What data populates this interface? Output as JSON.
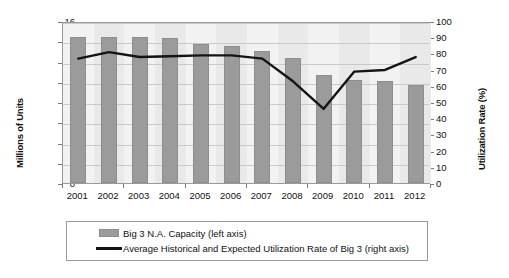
{
  "chart_data": {
    "type": "bar",
    "title": "",
    "subtitle": "",
    "xlabel": "",
    "ylabel": "Millions of Units",
    "y2label": "Utilization Rate (%)",
    "categories": [
      "2001",
      "2002",
      "2003",
      "2004",
      "2005",
      "2006",
      "2007",
      "2008",
      "2009",
      "2010",
      "2011",
      "2012"
    ],
    "ylim": [
      0,
      16
    ],
    "y2lim": [
      0,
      100
    ],
    "yticks": [
      16,
      14,
      12,
      10,
      8,
      6,
      4,
      2,
      0
    ],
    "y2ticks": [
      100,
      90,
      80,
      70,
      60,
      50,
      40,
      30,
      20,
      10,
      0
    ],
    "grid": true,
    "legend_position": "bottom",
    "series": [
      {
        "name": "Big 3 N.A. Capacity (left axis)",
        "type": "bar",
        "axis": "left",
        "color": "#9b9b9b",
        "values": [
          14.4,
          14.4,
          14.4,
          14.3,
          13.7,
          13.5,
          13.0,
          12.3,
          10.7,
          10.2,
          10.1,
          9.7
        ]
      },
      {
        "name": "Average Historical and Expected Utilization Rate of Big 3 (right axis)",
        "type": "line",
        "axis": "right",
        "color": "#141414",
        "values": [
          78,
          82,
          79,
          79.5,
          80,
          80,
          78,
          64,
          47,
          70,
          71,
          79
        ]
      }
    ]
  },
  "legend": {
    "items": [
      {
        "label": "Big 3 N.A. Capacity (left axis)",
        "marker": "bar-swatch"
      },
      {
        "label": "Average Historical and Expected Utilization Rate of Big 3 (right axis)",
        "marker": "line-swatch"
      }
    ]
  },
  "axes": {
    "left_title": "Millions of Units",
    "right_title": "Utilization Rate (%)"
  },
  "colors": {
    "bar": "#9b9b9b",
    "line": "#141414",
    "plot_background": "#f2f2f2",
    "band": "#e9e9e9",
    "gridline": "#c9c9c9",
    "frame": "#9a9a9a"
  }
}
